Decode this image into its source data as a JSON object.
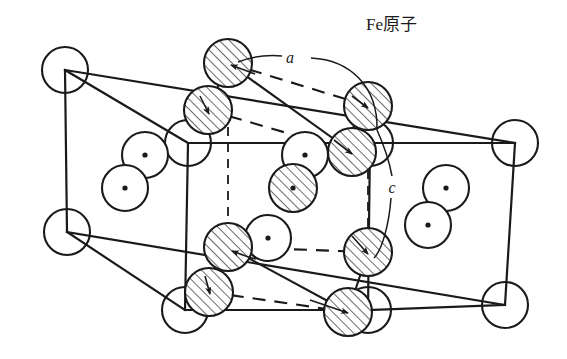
{
  "figure": {
    "title_label": "Fe原子",
    "type": "crystal-structure-diagram",
    "colors": {
      "line": "#1a1a1a",
      "hatch": "#1a1a1a",
      "background": "#ffffff"
    },
    "labels": {
      "fe_atom": "Fe原子",
      "axis_a": "a",
      "axis_c": "c"
    },
    "geometry": {
      "cell_vertices": {
        "rear_top_left": [
          65,
          70
        ],
        "rear_top_right": [
          515,
          143
        ],
        "rear_bottom_left": [
          67,
          232
        ],
        "rear_bottom_right": [
          505,
          305
        ],
        "front_top_left": [
          188,
          143
        ],
        "front_top_right": [
          370,
          143
        ],
        "front_bottom_left": [
          185,
          310
        ],
        "front_bottom_right": [
          368,
          310
        ]
      },
      "circle_radius_plain": 23,
      "circle_radius_hatched": 24,
      "circle_radius_dotted": 23
    },
    "atoms": {
      "corner_open": [
        {
          "id": "corner-rear-top-left",
          "cx": 65,
          "cy": 70
        },
        {
          "id": "corner-rear-top-right",
          "cx": 515,
          "cy": 143
        },
        {
          "id": "corner-rear-bottom-left",
          "cx": 67,
          "cy": 232
        },
        {
          "id": "corner-rear-bottom-right",
          "cx": 505,
          "cy": 305
        },
        {
          "id": "corner-front-top-left",
          "cx": 188,
          "cy": 143
        },
        {
          "id": "corner-front-bottom-left",
          "cx": 185,
          "cy": 310
        },
        {
          "id": "corner-front-top-right",
          "cx": 370,
          "cy": 143
        },
        {
          "id": "corner-front-bottom-right",
          "cx": 368,
          "cy": 310
        }
      ],
      "hatched": [
        {
          "id": "fe-top-rear-center",
          "cx": 228,
          "cy": 63
        },
        {
          "id": "fe-top-mid-left",
          "cx": 208,
          "cy": 110
        },
        {
          "id": "fe-top-right-upper",
          "cx": 368,
          "cy": 106
        },
        {
          "id": "fe-top-right-lower",
          "cx": 352,
          "cy": 152
        },
        {
          "id": "fe-body-center",
          "cx": 293,
          "cy": 188
        },
        {
          "id": "fe-bottom-left-upper",
          "cx": 228,
          "cy": 247
        },
        {
          "id": "fe-bottom-left-lower",
          "cx": 209,
          "cy": 292
        },
        {
          "id": "fe-bottom-right-upper",
          "cx": 368,
          "cy": 252
        },
        {
          "id": "fe-bottom-front-center",
          "cx": 348,
          "cy": 312
        }
      ],
      "dotted": [
        {
          "id": "site-left-upper",
          "cx": 145,
          "cy": 155
        },
        {
          "id": "site-left-lower",
          "cx": 125,
          "cy": 188
        },
        {
          "id": "site-mid-upper",
          "cx": 305,
          "cy": 155
        },
        {
          "id": "site-mid-lower",
          "cx": 268,
          "cy": 238
        },
        {
          "id": "site-right-upper",
          "cx": 446,
          "cy": 188
        },
        {
          "id": "site-right-lower",
          "cx": 428,
          "cy": 225
        },
        {
          "id": "site-body-center-dot",
          "cx": 293,
          "cy": 188
        }
      ]
    },
    "dashed_subcell": {
      "top_rear": [
        228,
        63
      ],
      "top_right": [
        368,
        106
      ],
      "top_left": [
        208,
        110
      ],
      "mid_right": [
        352,
        152
      ],
      "bottom_rear": [
        228,
        247
      ],
      "bottom_left": [
        209,
        292
      ],
      "bottom_right": [
        368,
        252
      ],
      "bottom_front": [
        348,
        312
      ]
    }
  }
}
